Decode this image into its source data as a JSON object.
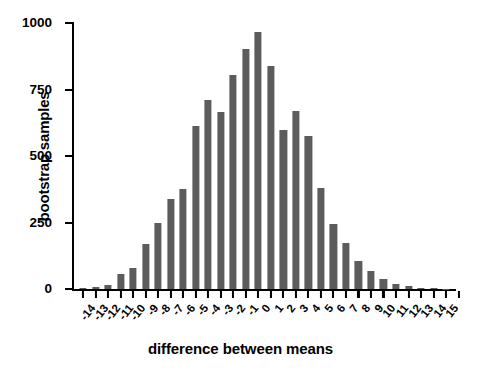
{
  "chart_data": {
    "type": "bar",
    "title": "",
    "xlabel": "difference between means",
    "ylabel": "bootstrap samples",
    "ylim": [
      0,
      1000
    ],
    "yticks": [
      0,
      250,
      500,
      750,
      1000
    ],
    "ytick_labels": [
      "0",
      "250",
      "500",
      "750",
      "1000"
    ],
    "grid": false,
    "legend": "none",
    "bar_color": "#5c5c5c",
    "axis_color": "#000000",
    "categories": [
      "-14",
      "-13",
      "-12",
      "-11",
      "-10",
      "-9",
      "-8",
      "-7",
      "-6",
      "-5",
      "-4",
      "-3",
      "-2",
      "-1",
      "0",
      "1",
      "2",
      "3",
      "4",
      "5",
      "6",
      "7",
      "8",
      "9",
      "10",
      "11",
      "12",
      "13",
      "14",
      "15"
    ],
    "values": [
      3,
      8,
      16,
      58,
      78,
      168,
      249,
      338,
      375,
      612,
      712,
      665,
      806,
      903,
      968,
      840,
      598,
      670,
      575,
      378,
      243,
      172,
      105,
      66,
      37,
      18,
      10,
      4,
      2,
      1
    ]
  }
}
